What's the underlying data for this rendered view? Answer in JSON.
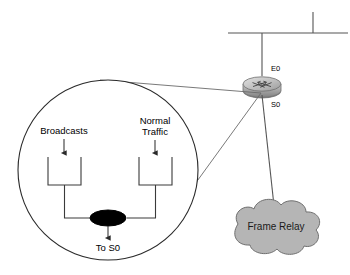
{
  "diagram": {
    "colors": {
      "wire": "#555555",
      "callout": "#6a6a6a",
      "cloud_fill": "#b5b5b5",
      "cloud_stroke": "#6f6f6f",
      "queue_stroke": "#3a3a3a",
      "node_fill": "#000000",
      "magnifier_stroke": "#2a2a2a",
      "router_body_top": "#d8d8d8",
      "router_body_bottom": "#8a8a8a",
      "background": "#ffffff"
    },
    "network": {
      "ethernet_segment_name": "ethernet-bus",
      "router_name": "router",
      "ports": [
        {
          "id": "e0",
          "label": "E0",
          "description": "ethernet-port-label"
        },
        {
          "id": "s0",
          "label": "S0",
          "description": "serial-port-label"
        }
      ],
      "cloud": {
        "label": "Frame Relay",
        "name": "frame-relay-cloud"
      }
    },
    "magnifier": {
      "name": "magnified-queue-view",
      "center_x": 108,
      "center_y": 170,
      "radius": 90,
      "inputs": [
        {
          "id": "broadcasts",
          "label": "Broadcasts",
          "lines": [
            "Broadcasts"
          ]
        },
        {
          "id": "normal_traffic",
          "label": "Normal Traffic",
          "lines": [
            "Normal",
            "Traffic"
          ]
        }
      ],
      "output": {
        "id": "to_s0",
        "label": "To S0"
      },
      "merge_node_name": "queue-merge-node"
    }
  }
}
